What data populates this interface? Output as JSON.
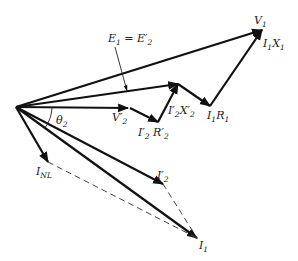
{
  "diagram": {
    "labels": {
      "v1": {
        "main": "V",
        "sub": "1"
      },
      "i1x1": {
        "main": "I",
        "sub1": "1",
        "mid": "X",
        "sub2": "1"
      },
      "e1": {
        "text": "E",
        "sub": "1",
        "eq": " = E′",
        "sub2": "2"
      },
      "v2p": {
        "main": "V′",
        "sub": "2"
      },
      "i2r2": {
        "main": "I′",
        "sub1": "2",
        "mid": " R′",
        "sub2": "2"
      },
      "i2x2": {
        "main": "I′",
        "sub1": "2",
        "mid": "X′",
        "sub2": "2"
      },
      "i1r1": {
        "main": "I",
        "sub1": "1",
        "mid": "R",
        "sub2": "1"
      },
      "theta": {
        "main": "θ",
        "sub": "2"
      },
      "inl": {
        "main": "I",
        "sub": "NL"
      },
      "i2p": {
        "main": "I′",
        "sub": "2"
      },
      "i1": {
        "main": "I",
        "sub": "1"
      }
    },
    "points": {
      "origin": [
        16,
        107
      ],
      "v1_tip": [
        262,
        30
      ],
      "e1_tip": [
        178,
        84
      ],
      "v2p_tip": [
        128,
        108
      ],
      "i2r2_tip": [
        158,
        122
      ],
      "i1r1_tip": [
        210,
        106
      ],
      "i2p_tip": [
        163,
        184
      ],
      "i1_tip": [
        197,
        238
      ],
      "inl_tip": [
        48,
        162
      ]
    },
    "color": "#111111"
  }
}
